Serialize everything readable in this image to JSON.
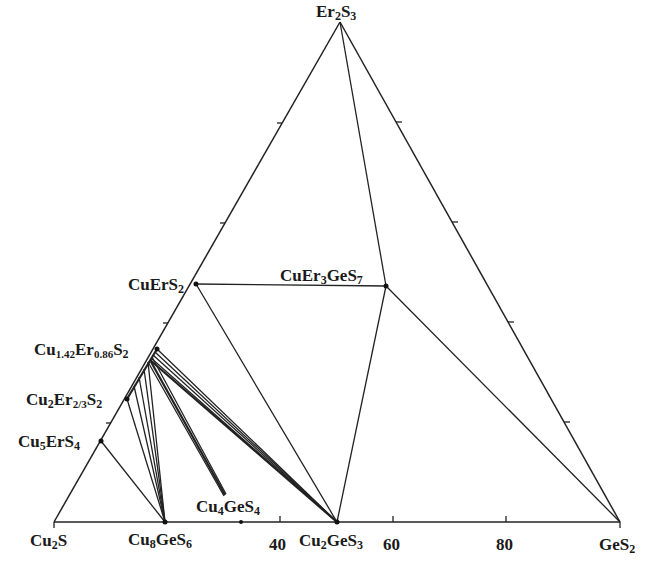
{
  "diagram": {
    "type": "ternary-phase-diagram",
    "vertices": {
      "bottom_left": "Cu2S",
      "bottom_right": "GeS2",
      "top": "Er2S3"
    },
    "labels": {
      "top": {
        "main": "Er",
        "s1": "2",
        "main2": "S",
        "s2": "3"
      },
      "cu2s": {
        "main": "Cu",
        "s1": "2",
        "main2": "S"
      },
      "ges2": {
        "main": "GeS",
        "s1": "2"
      },
      "cu8ges6": {
        "main": "Cu",
        "s1": "8",
        "main2": "GeS",
        "s2": "6"
      },
      "cu2ges3": {
        "main": "Cu",
        "s1": "2",
        "main2": "GeS",
        "s2": "3"
      },
      "cu4ges4": {
        "main": "Cu",
        "s1": "4",
        "main2": "GeS",
        "s2": "4"
      },
      "cuers2": {
        "main": "CuErS",
        "s1": "2"
      },
      "cuer3ges7": {
        "main": "CuEr",
        "s1": "3",
        "main2": "GeS",
        "s2": "7"
      },
      "cu142": {
        "main": "Cu",
        "s1": "1.42",
        "main2": "Er",
        "s2": "0.86",
        "main3": "S",
        "s3": "2"
      },
      "cu2er23": {
        "main": "Cu",
        "s1": "2",
        "main2": "Er",
        "s2": "2/3",
        "main3": "S",
        "s3": "2"
      },
      "cu5ers4": {
        "main": "Cu",
        "s1": "5",
        "main2": "ErS",
        "s2": "4"
      }
    },
    "axis_ticks": [
      "40",
      "60",
      "80"
    ],
    "compounds": [
      "Cu2S",
      "GeS2",
      "Er2S3",
      "Cu8GeS6",
      "Cu4GeS4",
      "Cu2GeS3",
      "CuErS2",
      "CuEr3GeS7",
      "Cu1.42Er0.86S2",
      "Cu2Er2/3S2",
      "Cu5ErS4"
    ]
  }
}
